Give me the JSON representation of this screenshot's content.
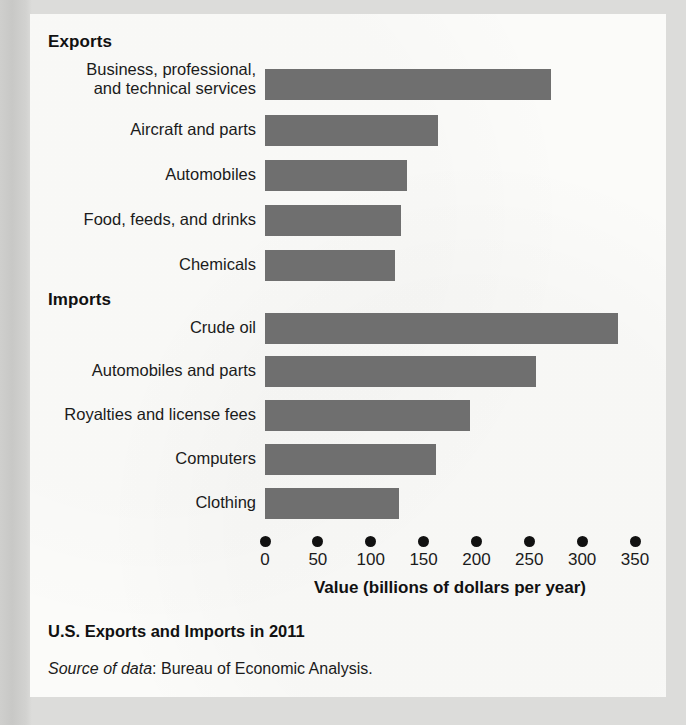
{
  "chart_data": {
    "type": "bar",
    "orientation": "horizontal",
    "title": "U.S. Exports and Imports in 2011",
    "source": "Source of data: Bureau of Economic Analysis.",
    "source_label": "Source of data",
    "source_rest": ": Bureau of Economic Analysis.",
    "xlabel": "Value (billions of dollars per year)",
    "ylabel": "",
    "xlim": [
      0,
      350
    ],
    "xticks": [
      0,
      50,
      100,
      150,
      200,
      250,
      300,
      350
    ],
    "xtick_labels": [
      "0",
      "50",
      "100",
      "150",
      "200",
      "250",
      "300",
      "350"
    ],
    "grid": false,
    "legend": false,
    "bar_color": "#6f6f6f",
    "groups": [
      {
        "name": "Exports",
        "categories": [
          "Business, professional, and technical services",
          "Aircraft and parts",
          "Automobiles",
          "Food, feeds, and drinks",
          "Chemicals"
        ],
        "values": [
          271,
          164,
          134,
          129,
          123
        ]
      },
      {
        "name": "Imports",
        "categories": [
          "Crude oil",
          "Automobiles and parts",
          "Royalties and license fees",
          "Computers",
          "Clothing"
        ],
        "values": [
          334,
          256,
          194,
          162,
          127
        ]
      }
    ]
  },
  "sections": {
    "exports_heading": "Exports",
    "imports_heading": "Imports"
  },
  "rows": [
    {
      "label_line1": "Business, professional,",
      "label_line2": "and technical services",
      "value": 271
    },
    {
      "label_line1": "Aircraft and parts",
      "label_line2": "",
      "value": 164
    },
    {
      "label_line1": "Automobiles",
      "label_line2": "",
      "value": 134
    },
    {
      "label_line1": "Food, feeds, and drinks",
      "label_line2": "",
      "value": 129
    },
    {
      "label_line1": "Chemicals",
      "label_line2": "",
      "value": 123
    },
    {
      "label_line1": "Crude oil",
      "label_line2": "",
      "value": 334
    },
    {
      "label_line1": "Automobiles and parts",
      "label_line2": "",
      "value": 256
    },
    {
      "label_line1": "Royalties and license fees",
      "label_line2": "",
      "value": 194
    },
    {
      "label_line1": "Computers",
      "label_line2": "",
      "value": 162
    },
    {
      "label_line1": "Clothing",
      "label_line2": "",
      "value": 127
    }
  ]
}
